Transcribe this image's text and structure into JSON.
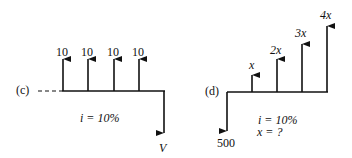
{
  "diagrams": [
    {
      "id": "c",
      "label": "(c)",
      "interest": "i = 10%",
      "inflows": [
        {
          "period": 1,
          "label": "10",
          "value": 10
        },
        {
          "period": 2,
          "label": "10",
          "value": 10
        },
        {
          "period": 3,
          "label": "10",
          "value": 10
        },
        {
          "period": 4,
          "label": "10",
          "value": 10
        }
      ],
      "outflow": {
        "period": 5,
        "label": "V"
      }
    },
    {
      "id": "d",
      "label": "(d)",
      "interest": "i = 10%",
      "unknown": "x = ?",
      "outflow": {
        "period": 0,
        "label": "500",
        "value": 500
      },
      "inflows": [
        {
          "period": 1,
          "label": "x"
        },
        {
          "period": 2,
          "label": "2x"
        },
        {
          "period": 3,
          "label": "3x"
        },
        {
          "period": 4,
          "label": "4x"
        }
      ]
    }
  ],
  "colors": {
    "ink": "#111111",
    "background": "#ffffff"
  }
}
